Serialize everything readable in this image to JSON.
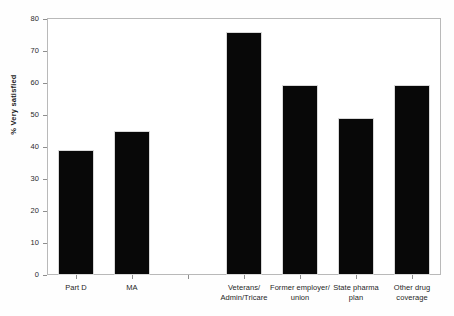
{
  "chart_data": {
    "type": "bar",
    "title": "",
    "xlabel": "",
    "ylabel": "% Very satisfied",
    "ylim": [
      0,
      80
    ],
    "yticks": [
      0,
      10,
      20,
      30,
      40,
      50,
      60,
      70,
      80
    ],
    "ytick_labels": [
      "0",
      "10",
      "20",
      "30",
      "40",
      "50",
      "60",
      "70",
      "80"
    ],
    "grid": false,
    "legend": null,
    "bar_color": "#080808",
    "frame_color": "#b9b9b9",
    "categories": [
      "Part D",
      "MA",
      "",
      "Veterans/\nAdmin/Tricare",
      "Former employer/\nunion",
      "State pharma\nplan",
      "Other drug\ncoverage"
    ],
    "values": [
      39,
      45,
      null,
      76,
      59.5,
      49,
      59.5
    ]
  }
}
